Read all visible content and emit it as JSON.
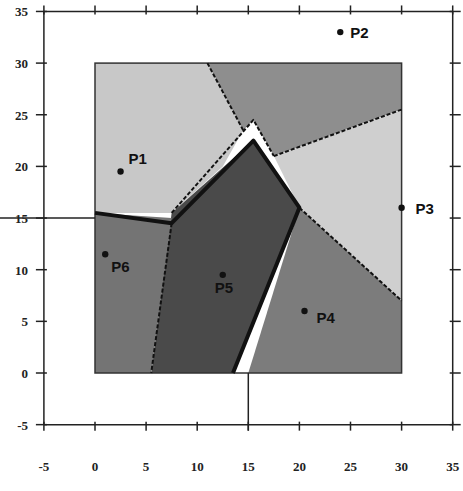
{
  "chart_data": {
    "type": "scatter",
    "title": "",
    "xlabel": "",
    "ylabel": "",
    "xlim": [
      -5,
      35
    ],
    "ylim": [
      -5,
      35
    ],
    "grid": false,
    "x_ticks": [
      -5,
      0,
      5,
      10,
      15,
      20,
      25,
      30,
      35
    ],
    "y_ticks": [
      -5,
      0,
      5,
      10,
      15,
      20,
      25,
      30,
      35
    ],
    "bounding_box": {
      "x0": 0,
      "y0": 0,
      "x1": 30,
      "y1": 30
    },
    "crosshair": {
      "x": 15,
      "y": 15
    },
    "points": [
      {
        "name": "P1",
        "x": 2.5,
        "y": 19.5
      },
      {
        "name": "P2",
        "x": 24,
        "y": 33
      },
      {
        "name": "P3",
        "x": 30,
        "y": 16
      },
      {
        "name": "P4",
        "x": 20.5,
        "y": 6
      },
      {
        "name": "P5",
        "x": 12.5,
        "y": 9.5
      },
      {
        "name": "P6",
        "x": 1,
        "y": 11.5
      }
    ],
    "regions": [
      {
        "site": "P1",
        "fill": "#c8c8c8",
        "polygon": [
          [
            0,
            30
          ],
          [
            11,
            30
          ],
          [
            14.5,
            23.5
          ],
          [
            12.5,
            20
          ],
          [
            7.5,
            15.5
          ],
          [
            0,
            15.5
          ]
        ]
      },
      {
        "site": "P2",
        "fill": "#8e8e8e",
        "polygon": [
          [
            11,
            30
          ],
          [
            30,
            30
          ],
          [
            30,
            25.5
          ],
          [
            17.5,
            21
          ],
          [
            15.5,
            24.5
          ],
          [
            14.5,
            23.5
          ]
        ]
      },
      {
        "site": "P3",
        "fill": "#cfcfcf",
        "polygon": [
          [
            30,
            25.5
          ],
          [
            30,
            7
          ],
          [
            20,
            16
          ],
          [
            17.5,
            21
          ]
        ]
      },
      {
        "site": "P4",
        "fill": "#7c7c7c",
        "polygon": [
          [
            30,
            7
          ],
          [
            30,
            0
          ],
          [
            15,
            0
          ],
          [
            20,
            16
          ]
        ]
      },
      {
        "site": "P5",
        "fill": "#4a4a4a",
        "polygon": [
          [
            7.5,
            15.5
          ],
          [
            15.5,
            22.5
          ],
          [
            20,
            16
          ],
          [
            13.5,
            0
          ],
          [
            5.5,
            0
          ]
        ]
      },
      {
        "site": "P6",
        "fill": "#747474",
        "polygon": [
          [
            0,
            15.5
          ],
          [
            7.5,
            15
          ],
          [
            5.5,
            0
          ],
          [
            0,
            0
          ]
        ]
      }
    ],
    "boundary_lines": [
      {
        "style": "solid-thick",
        "points": [
          [
            0,
            15.5
          ],
          [
            7.5,
            14.5
          ],
          [
            15.5,
            22.5
          ],
          [
            20,
            16
          ],
          [
            13.5,
            0
          ]
        ]
      },
      {
        "style": "dashed",
        "points": [
          [
            11,
            30
          ],
          [
            14.5,
            23.5
          ]
        ]
      },
      {
        "style": "dashed",
        "points": [
          [
            17.5,
            21
          ],
          [
            30,
            25.5
          ]
        ]
      },
      {
        "style": "dashed",
        "points": [
          [
            20,
            16
          ],
          [
            30,
            7
          ]
        ]
      },
      {
        "style": "dashed",
        "points": [
          [
            7.5,
            14.5
          ],
          [
            5.5,
            0
          ]
        ]
      },
      {
        "style": "dashed",
        "points": [
          [
            7.5,
            15.5
          ],
          [
            15.5,
            24.5
          ],
          [
            17.5,
            21
          ]
        ]
      }
    ]
  }
}
